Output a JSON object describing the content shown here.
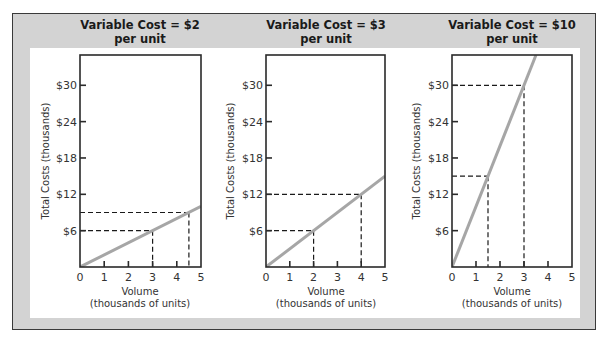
{
  "figure": {
    "colors": {
      "frame_bg": "#d3d3d3",
      "panel_bg": "#ffffff",
      "axis": "#2a2a2a",
      "cost_line": "#a6a6a6",
      "guide": "#1a1a1a"
    }
  },
  "chart_data": [
    {
      "type": "line",
      "title": "Variable Cost = $2 per unit",
      "title_lines": [
        "Variable Cost = $2",
        "per unit"
      ],
      "xlabel": "Volume (thousands of units)",
      "xlabel_lines": [
        "Volume",
        "(thousands of units)"
      ],
      "ylabel": "Total Costs (thousands)",
      "x_ticks": [
        "0",
        "1",
        "2",
        "3",
        "4",
        "5"
      ],
      "y_ticks": [
        "$6",
        "$12",
        "$18",
        "$24",
        "$30"
      ],
      "y_tick_values": [
        6,
        12,
        18,
        24,
        30
      ],
      "xlim": [
        0,
        5
      ],
      "ylim": [
        0,
        35
      ],
      "grid": false,
      "series": [
        {
          "name": "Total Cost",
          "x": [
            0,
            5
          ],
          "y": [
            0,
            10
          ]
        }
      ],
      "guides": [
        {
          "x": 3,
          "y": 6
        },
        {
          "x": 4.5,
          "y": 9
        }
      ]
    },
    {
      "type": "line",
      "title": "Variable Cost = $3 per unit",
      "title_lines": [
        "Variable Cost = $3",
        "per unit"
      ],
      "xlabel": "Volume (thousands of units)",
      "xlabel_lines": [
        "Volume",
        "(thousands of units)"
      ],
      "ylabel": "Total Costs (thousands)",
      "x_ticks": [
        "0",
        "1",
        "2",
        "3",
        "4",
        "5"
      ],
      "y_ticks": [
        "$6",
        "$12",
        "$18",
        "$24",
        "$30"
      ],
      "y_tick_values": [
        6,
        12,
        18,
        24,
        30
      ],
      "xlim": [
        0,
        5
      ],
      "ylim": [
        0,
        35
      ],
      "grid": false,
      "series": [
        {
          "name": "Total Cost",
          "x": [
            0,
            5
          ],
          "y": [
            0,
            15
          ]
        }
      ],
      "guides": [
        {
          "x": 2,
          "y": 6
        },
        {
          "x": 4,
          "y": 12
        }
      ]
    },
    {
      "type": "line",
      "title": "Variable Cost = $10 per unit",
      "title_lines": [
        "Variable Cost = $10",
        "per unit"
      ],
      "xlabel": "Volume (thousands of units)",
      "xlabel_lines": [
        "Volume",
        "(thousands of units)"
      ],
      "ylabel": "Total Costs (thousands)",
      "x_ticks": [
        "0",
        "1",
        "2",
        "3",
        "4",
        "5"
      ],
      "y_ticks": [
        "$6",
        "$12",
        "$18",
        "$24",
        "$30"
      ],
      "y_tick_values": [
        6,
        12,
        18,
        24,
        30
      ],
      "xlim": [
        0,
        5
      ],
      "ylim": [
        0,
        35
      ],
      "grid": false,
      "series": [
        {
          "name": "Total Cost",
          "x": [
            0,
            3.5
          ],
          "y": [
            0,
            35
          ]
        }
      ],
      "guides": [
        {
          "x": 1.5,
          "y": 15
        },
        {
          "x": 3,
          "y": 30
        }
      ]
    }
  ]
}
